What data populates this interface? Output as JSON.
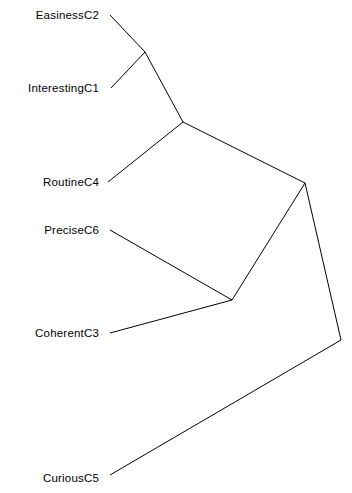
{
  "figure": {
    "type": "unrooted-tree-diagram",
    "title": "",
    "background_color": "#ffffff",
    "line_color": "#000000",
    "text_color": "#000000",
    "line_width": 1
  },
  "leaves": [
    {
      "id": "C2",
      "name": "Easiness",
      "code": "C2",
      "name_x": 6,
      "code_x": 84,
      "y": 15
    },
    {
      "id": "C1",
      "name": "Interesting",
      "code": "C1",
      "name_x": 6,
      "code_x": 84,
      "y": 88
    },
    {
      "id": "C4",
      "name": "Routine",
      "code": "C4",
      "name_x": 6,
      "code_x": 84,
      "y": 182
    },
    {
      "id": "C6",
      "name": "Precise",
      "code": "C6",
      "name_x": 6,
      "code_x": 84,
      "y": 230
    },
    {
      "id": "C3",
      "name": "Coherent",
      "code": "C3",
      "name_x": 6,
      "code_x": 84,
      "y": 333
    },
    {
      "id": "C5",
      "name": "Curious",
      "code": "C5",
      "name_x": 6,
      "code_x": 84,
      "y": 478
    }
  ],
  "chart_data": {
    "type": "tree",
    "title": "",
    "xlabel": "",
    "ylabel": "",
    "nodes": [
      {
        "id": "C2",
        "label": "C2",
        "x": 110,
        "y": 15,
        "kind": "leaf"
      },
      {
        "id": "C1",
        "label": "C1",
        "x": 111,
        "y": 88,
        "kind": "leaf"
      },
      {
        "id": "C4",
        "label": "C4",
        "x": 108,
        "y": 182,
        "kind": "leaf"
      },
      {
        "id": "C6",
        "label": "C6",
        "x": 110,
        "y": 230,
        "kind": "leaf"
      },
      {
        "id": "C3",
        "label": "C3",
        "x": 110,
        "y": 333,
        "kind": "leaf"
      },
      {
        "id": "C5",
        "label": "C5",
        "x": 110,
        "y": 475,
        "kind": "leaf"
      },
      {
        "id": "N1",
        "label": "",
        "x": 145,
        "y": 52,
        "kind": "internal"
      },
      {
        "id": "N2",
        "label": "",
        "x": 183,
        "y": 122,
        "kind": "internal"
      },
      {
        "id": "N3",
        "label": "",
        "x": 305,
        "y": 183,
        "kind": "internal"
      },
      {
        "id": "N4",
        "label": "",
        "x": 232,
        "y": 300,
        "kind": "internal"
      },
      {
        "id": "N5",
        "label": "",
        "x": 341,
        "y": 340,
        "kind": "internal"
      }
    ],
    "edges": [
      {
        "from": "C2",
        "to": "N1"
      },
      {
        "from": "C1",
        "to": "N1"
      },
      {
        "from": "N1",
        "to": "N2"
      },
      {
        "from": "C4",
        "to": "N2"
      },
      {
        "from": "N2",
        "to": "N3"
      },
      {
        "from": "N3",
        "to": "N4"
      },
      {
        "from": "C6",
        "to": "N4"
      },
      {
        "from": "C3",
        "to": "N4"
      },
      {
        "from": "N3",
        "to": "N5"
      },
      {
        "from": "N5",
        "to": "C5"
      }
    ],
    "clusters": [
      {
        "members": [
          "C2",
          "C1"
        ],
        "node": "N1"
      },
      {
        "members": [
          "C2",
          "C1",
          "C4"
        ],
        "node": "N2"
      },
      {
        "members": [
          "C6",
          "C3"
        ],
        "node": "N4"
      },
      {
        "members": [
          "C2",
          "C1",
          "C4",
          "C6",
          "C3"
        ],
        "node": "N3"
      },
      {
        "members": [
          "C2",
          "C1",
          "C4",
          "C6",
          "C3",
          "C5"
        ],
        "node": "N5"
      }
    ]
  }
}
